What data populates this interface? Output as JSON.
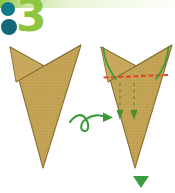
{
  "page": {
    "title": "Origami folding instruction - step 3",
    "background_color": "#ffffff",
    "width": 175,
    "height": 193
  },
  "top_bar": {
    "name": "decorative-top-rule",
    "start_color": "#8cc63f",
    "end_color": "#fdfffb"
  },
  "step_badge": {
    "number": "3",
    "number_color": "#8cc63f",
    "dot_color": "#0f7a8a",
    "dots": [
      {
        "cx": 8,
        "cy": 9,
        "r": 7
      },
      {
        "cx": 9,
        "cy": 27,
        "r": 8
      }
    ]
  },
  "colors": {
    "paper_fill": "#c0a152",
    "paper_fill_light": "#cbb06a",
    "paper_edge": "#8a7232",
    "valley_fold_red": "#e0452a",
    "arrow_green": "#3f9b3f",
    "arrow_green_dark": "#2f7d2f",
    "swirl_green": "#3a9a3a",
    "triangle_green": "#3f9b3f"
  },
  "figures": [
    {
      "id": "figure-before",
      "label": "Folded paper before step",
      "tip": {
        "x": 43,
        "y": 168
      },
      "left_peak": {
        "x": 10,
        "y": 47
      },
      "right_peak": {
        "x": 81,
        "y": 45
      },
      "notch": {
        "x": 44,
        "y": 66
      },
      "fold_lines": [
        {
          "type": "mountain",
          "from": {
            "x": 16,
            "y": 82
          },
          "to": {
            "x": 81,
            "y": 45
          }
        }
      ]
    },
    {
      "id": "figure-after",
      "label": "Folded paper with fold indications",
      "tip": {
        "x": 135,
        "y": 168
      },
      "left_peak": {
        "x": 101,
        "y": 47
      },
      "right_peak": {
        "x": 172,
        "y": 45
      },
      "notch": {
        "x": 136,
        "y": 66
      },
      "fold_lines": [
        {
          "type": "mountain",
          "from": {
            "x": 108,
            "y": 82
          },
          "to": {
            "x": 172,
            "y": 45
          }
        },
        {
          "type": "valley-dashed-red",
          "from": {
            "x": 104,
            "y": 77
          },
          "to": {
            "x": 168,
            "y": 75
          }
        }
      ],
      "curved_arrows": [
        {
          "name": "fold-arrow-left",
          "from": {
            "x": 115,
            "y": 78
          },
          "to": {
            "x": 104,
            "y": 48
          }
        },
        {
          "name": "fold-arrow-right",
          "from": {
            "x": 157,
            "y": 78
          },
          "to": {
            "x": 168,
            "y": 47
          }
        }
      ],
      "dashed_down_arrows": [
        {
          "name": "pull-down-arrow-left",
          "x": 120,
          "from_y": 82,
          "to_y": 119
        },
        {
          "name": "pull-down-arrow-right",
          "x": 134,
          "from_y": 82,
          "to_y": 119
        }
      ]
    }
  ],
  "swirl_arrow": {
    "name": "turn-over-swirl-arrow",
    "description": "Looping arrow pointing right indicating the next figure",
    "start": {
      "x": 70,
      "y": 122
    },
    "end": {
      "x": 112,
      "y": 118
    },
    "color": "#3a9a3a"
  },
  "bottom_marker": {
    "name": "next-step-triangle",
    "shape": "down-triangle",
    "color": "#3f9b3f",
    "center_x": 141,
    "top_y": 176,
    "half_width": 8,
    "height": 12
  }
}
